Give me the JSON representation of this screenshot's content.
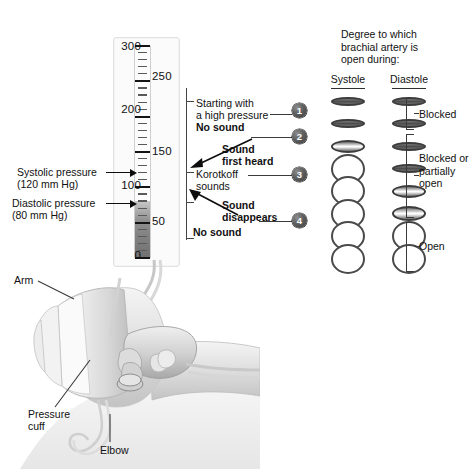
{
  "manometer": {
    "scale_numbers_left": [
      "300",
      "200",
      "100",
      "0"
    ],
    "scale_numbers_right": [
      "250",
      "150",
      "50"
    ],
    "mercury_top_value": 80
  },
  "pressure_labels": {
    "systolic": {
      "line1": "Systolic pressure",
      "line2": "(120 mm Hg)",
      "value": 120
    },
    "diastolic": {
      "line1": "Diastolic pressure",
      "line2": "(80 mm Hg)",
      "value": 80
    }
  },
  "annotations": [
    {
      "num": "1",
      "line1": "Starting with",
      "line2": "a high pressure",
      "line3": "No sound"
    },
    {
      "num": "2",
      "line1": "Sound",
      "line2": "first heard"
    },
    {
      "num": "3",
      "line1": "Korotkoff",
      "line2": "sounds"
    },
    {
      "num": "4",
      "line1": "Sound",
      "line2": "disappears",
      "line3": "No sound"
    }
  ],
  "annotation_text": {
    "starting_with": "Starting with",
    "a_high_pressure": "a high pressure",
    "no_sound_top": "No sound",
    "sound": "Sound",
    "first_heard": "first heard",
    "korotkoff": "Korotkoff",
    "sounds": "sounds",
    "sound2": "Sound",
    "disappears": "disappears",
    "no_sound_bottom": "No sound"
  },
  "right_panel": {
    "title_line1": "Degree to which",
    "title_line2": "brachial artery is",
    "title_line3": "open during:",
    "columns": [
      "Systole",
      "Diastole"
    ],
    "rows": [
      {
        "systole": "closed",
        "diastole": "closed"
      },
      {
        "systole": "closed",
        "diastole": "closed"
      },
      {
        "systole": "slit",
        "diastole": "closed"
      },
      {
        "systole": "open",
        "diastole": "closed"
      },
      {
        "systole": "open",
        "diastole": "slit"
      },
      {
        "systole": "open",
        "diastole": "slit-open"
      },
      {
        "systole": "open",
        "diastole": "open"
      },
      {
        "systole": "open",
        "diastole": "open"
      }
    ],
    "braces": [
      {
        "label": "Blocked"
      },
      {
        "label_line1": "Blocked or",
        "label_line2": "partially",
        "label_line3": "open"
      },
      {
        "label": "Open"
      }
    ]
  },
  "illustration_labels": {
    "arm": "Arm",
    "pressure_cuff_line1": "Pressure",
    "pressure_cuff_line2": "cuff",
    "elbow": "Elbow"
  },
  "colors": {
    "ink": "#111111",
    "vessel_stroke": "#4a4a4a",
    "mercury": "#707070",
    "panel_bg": "#fbfbfb"
  }
}
